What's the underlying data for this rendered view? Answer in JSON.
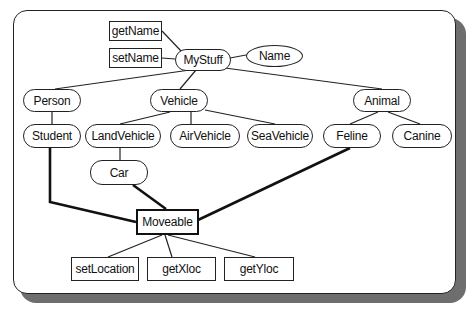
{
  "diagram": {
    "type": "class-hierarchy",
    "nodes": {
      "getName": "getName",
      "setName": "setName",
      "MyStuff": "MyStuff",
      "Name": "Name",
      "Person": "Person",
      "Vehicle": "Vehicle",
      "Animal": "Animal",
      "Student": "Student",
      "LandVehicle": "LandVehicle",
      "AirVehicle": "AirVehicle",
      "SeaVehicle": "SeaVehicle",
      "Feline": "Feline",
      "Canine": "Canine",
      "Car": "Car",
      "Moveable": "Moveable",
      "setLocation": "setLocation",
      "getXloc": "getXloc",
      "getYloc": "getYloc"
    },
    "edges": [
      [
        "getName",
        "MyStuff"
      ],
      [
        "setName",
        "MyStuff"
      ],
      [
        "MyStuff",
        "Name"
      ],
      [
        "MyStuff",
        "Person"
      ],
      [
        "MyStuff",
        "Vehicle"
      ],
      [
        "MyStuff",
        "Animal"
      ],
      [
        "Person",
        "Student"
      ],
      [
        "Vehicle",
        "LandVehicle"
      ],
      [
        "Vehicle",
        "AirVehicle"
      ],
      [
        "Vehicle",
        "SeaVehicle"
      ],
      [
        "Animal",
        "Feline"
      ],
      [
        "Animal",
        "Canine"
      ],
      [
        "LandVehicle",
        "Car"
      ],
      [
        "Student",
        "Moveable"
      ],
      [
        "Car",
        "Moveable"
      ],
      [
        "Feline",
        "Moveable"
      ],
      [
        "Moveable",
        "setLocation"
      ],
      [
        "Moveable",
        "getXloc"
      ],
      [
        "Moveable",
        "getYloc"
      ]
    ],
    "caption": ""
  }
}
